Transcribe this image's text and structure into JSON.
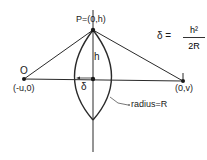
{
  "diagram": {
    "labels": {
      "point_p": "P=(0,h)",
      "point_o": "O",
      "point_o_coords": "(-u,0)",
      "point_i": "I",
      "point_i_coords": "(0,v)",
      "height": "h",
      "sag": "δ",
      "radius": "radius=R"
    },
    "formula": {
      "lhs": "δ =",
      "numerator": "h²",
      "denominator": "2R"
    },
    "colors": {
      "line": "#2a2a2a",
      "text": "#1a1a1a",
      "background": "#ffffff"
    }
  }
}
